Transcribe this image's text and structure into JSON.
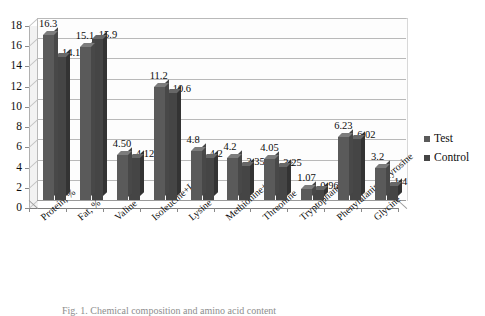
{
  "chart_data": {
    "type": "bar",
    "title": "",
    "subtitle": "",
    "xlabel": "",
    "ylabel": "",
    "ylim": [
      0,
      18
    ],
    "yticks": [
      0,
      2,
      4,
      6,
      8,
      10,
      12,
      14,
      16,
      18
    ],
    "grid": true,
    "legend_position": "right",
    "style": "3d-clustered-column",
    "categories": [
      "Protein, %",
      "Fat, %",
      "Valine",
      "Isoleucine+Leucine",
      "Lysine",
      "Methionine+Cysteine",
      "Threonine",
      "Tryptophane",
      "Phenylalanine+Tyrosine",
      "Glycine"
    ],
    "series": [
      {
        "name": "Test",
        "color": "#5a5a5a",
        "values": [
          16.3,
          15.1,
          4.5,
          11.2,
          4.8,
          4.2,
          4.05,
          1.07,
          6.23,
          3.2
        ],
        "labels": [
          "16.3",
          "15.1",
          "4.50",
          "11.2",
          "4.8",
          "4.2",
          "4.05",
          "1.07",
          "6.23",
          "3.2"
        ]
      },
      {
        "name": "Control",
        "color": "#454545",
        "values": [
          14.1,
          15.9,
          4.12,
          10.6,
          4.2,
          3.35,
          3.25,
          0.96,
          6.02,
          1.4
        ],
        "labels": [
          "14.1",
          "15.9",
          "4.12",
          "10.6",
          "4.2",
          "3.35",
          "3.25",
          "0.96",
          "6.02",
          "1.4"
        ]
      }
    ]
  },
  "legend": {
    "items": [
      {
        "label": "Test",
        "color": "#5a5a5a"
      },
      {
        "label": "Control",
        "color": "#454545"
      }
    ]
  },
  "caption": {
    "text": "Fig. 1. Chemical composition and amino acid content"
  },
  "colors": {
    "series_test": "#5a5a5a",
    "series_control": "#454545",
    "gridline": "#b9b9b9",
    "axis": "#8a8a8a",
    "text": "#0d0d0d",
    "plot_background": "#fdfdfd"
  }
}
